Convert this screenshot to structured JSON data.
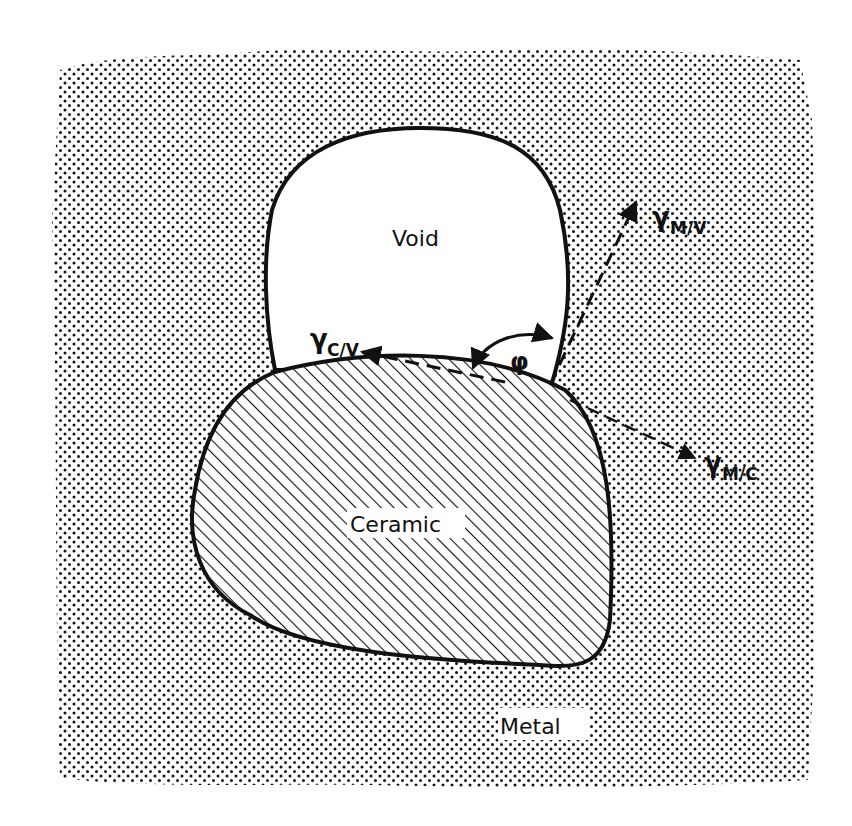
{
  "figure": {
    "type": "schematic",
    "colors": {
      "ink": "#111111",
      "background": "#ffffff",
      "fill_void": "#ffffff"
    },
    "regions": {
      "void": {
        "label": "Void"
      },
      "ceramic": {
        "label": "Ceramic",
        "fill": "diagonal-hatch"
      },
      "metal": {
        "label": "Metal",
        "fill": "dot-screen"
      }
    },
    "vectors": [
      {
        "id": "m_v",
        "symbol": "γ",
        "subscript": "M/V"
      },
      {
        "id": "c_v",
        "symbol": "γ",
        "subscript": "C/V"
      },
      {
        "id": "m_c",
        "symbol": "γ",
        "subscript": "M/C"
      }
    ],
    "angle": {
      "symbol": "φ"
    }
  }
}
